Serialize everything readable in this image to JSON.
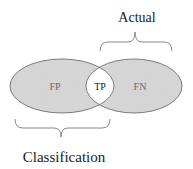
{
  "diagram": {
    "title_top": "Actual",
    "title_bottom": "Classification",
    "regions": [
      {
        "id": "fp",
        "label": "FP",
        "meaning": "left-only region"
      },
      {
        "id": "tp",
        "label": "TP",
        "meaning": "intersection"
      },
      {
        "id": "fn",
        "label": "FN",
        "meaning": "right-only region"
      }
    ],
    "sets": [
      {
        "name": "Classification",
        "covers": [
          "FP",
          "TP"
        ]
      },
      {
        "name": "Actual",
        "covers": [
          "TP",
          "FN"
        ]
      }
    ],
    "colors": {
      "fill": "#d2d2d2",
      "stroke": "#6e6e6e",
      "intersection_fill": "#ffffff",
      "region_text": "#6a6a6a",
      "text": "#1a1a1a",
      "brace": "#7a7a7a"
    }
  }
}
